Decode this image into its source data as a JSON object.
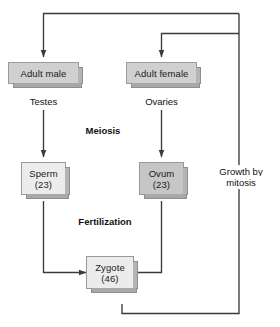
{
  "diagram": {
    "type": "flow-diagram",
    "colors": {
      "background": "#ffffff",
      "box_fill_mid": "#d0d0d0",
      "box_fill_light": "#ececec",
      "box_fill_dark": "#c6c6c6",
      "box_shadow": "#a8a8a8",
      "box_border": "#9a9a9a",
      "line": "#3a3a3a",
      "text": "#111111"
    },
    "nodes": [
      {
        "id": "adult-male",
        "line1": "Adult male",
        "line2": ""
      },
      {
        "id": "adult-female",
        "line1": "Adult female",
        "line2": ""
      },
      {
        "id": "sperm",
        "line1": "Sperm",
        "line2": "(23)"
      },
      {
        "id": "ovum",
        "line1": "Ovum",
        "line2": "(23)"
      },
      {
        "id": "zygote",
        "line1": "Zygote",
        "line2": "(46)"
      }
    ],
    "captions": [
      {
        "id": "testes",
        "text": "Testes"
      },
      {
        "id": "ovaries",
        "text": "Ovaries"
      },
      {
        "id": "meiosis",
        "text": "Meiosis"
      },
      {
        "id": "fertilization",
        "text": "Fertilization"
      },
      {
        "id": "growth-line1",
        "text": "Growth by"
      },
      {
        "id": "growth-line2",
        "text": "mitosis"
      }
    ],
    "edges": [
      {
        "from": "testes",
        "to": "sperm",
        "label": "Meiosis"
      },
      {
        "from": "ovaries",
        "to": "ovum",
        "label": "Meiosis"
      },
      {
        "from": "sperm",
        "to": "zygote",
        "label": "Fertilization"
      },
      {
        "from": "ovum",
        "to": "zygote",
        "label": "Fertilization"
      },
      {
        "from": "zygote",
        "to": "adult-male",
        "label": "Growth by mitosis"
      },
      {
        "from": "zygote",
        "to": "adult-female",
        "label": "Growth by mitosis"
      }
    ]
  }
}
